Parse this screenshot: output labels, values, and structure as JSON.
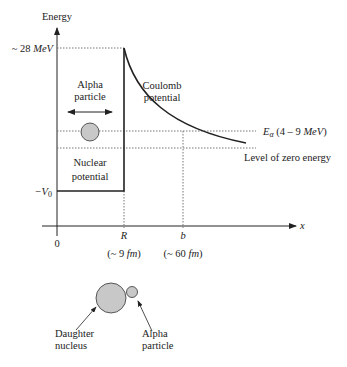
{
  "diagram": {
    "y_axis_label": "Energy",
    "x_axis_label": "x",
    "barrier_label": "~ 28 MeV",
    "barrier_label_prefix": "~ 28 ",
    "barrier_label_unit": "MeV",
    "neg_v0_label": "−V",
    "neg_v0_sub": "0",
    "origin_label": "0",
    "r_label": "R",
    "r_value": "(~ 9 fm)",
    "r_value_a": "(~ 9 ",
    "r_value_unit": "fm",
    "r_value_b": ")",
    "b_label": "b",
    "b_value_a": "(~ 60 ",
    "b_value_unit": "fm",
    "b_value_b": ")",
    "alpha_particle_line1": "Alpha",
    "alpha_particle_line2": "particle",
    "nuclear_potential_line1": "Nuclear",
    "nuclear_potential_line2": "potential",
    "coulomb_line1": "Coulomb",
    "coulomb_line2": "potential",
    "e_alpha_symbol": "E",
    "e_alpha_sub": "α",
    "e_alpha_range_a": " (4 – 9 ",
    "e_alpha_range_unit": "MeV",
    "e_alpha_range_b": ")",
    "zero_energy_label": "Level of zero energy",
    "daughter_line1": "Daughter",
    "daughter_line2": "nucleus",
    "alpha_small_line1": "Alpha",
    "alpha_small_line2": "particle",
    "colors": {
      "particle_fill": "#c8c8c8",
      "line": "#222222",
      "dotted": "#777777"
    }
  }
}
